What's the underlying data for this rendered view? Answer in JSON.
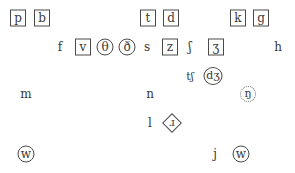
{
  "diagram": {
    "legend_styles": {
      "box": "boxed symbol",
      "circle": "circled symbol",
      "dcircle": "dotted-circle symbol",
      "diamond": "diamond-framed symbol",
      "plain": "unmarked symbol"
    },
    "symbols": [
      {
        "id": "p",
        "glyph": "p",
        "style": "box",
        "x": 18,
        "y": 18
      },
      {
        "id": "b",
        "glyph": "b",
        "style": "box",
        "x": 42,
        "y": 18
      },
      {
        "id": "t",
        "glyph": "t",
        "style": "box",
        "x": 148,
        "y": 18
      },
      {
        "id": "d",
        "glyph": "d",
        "style": "box",
        "x": 171,
        "y": 18
      },
      {
        "id": "k",
        "glyph": "k",
        "style": "box",
        "x": 238,
        "y": 18
      },
      {
        "id": "g",
        "glyph": "g",
        "style": "box",
        "x": 261,
        "y": 18
      },
      {
        "id": "f",
        "glyph": "f",
        "style": "plain",
        "x": 60,
        "y": 47
      },
      {
        "id": "v",
        "glyph": "v",
        "style": "box",
        "x": 83,
        "y": 47
      },
      {
        "id": "theta",
        "glyph": "θ",
        "style": "circle",
        "x": 105,
        "y": 47
      },
      {
        "id": "eth",
        "glyph": "ð",
        "style": "circle",
        "x": 127,
        "y": 47
      },
      {
        "id": "s",
        "glyph": "s",
        "style": "plain",
        "x": 147,
        "y": 47
      },
      {
        "id": "z",
        "glyph": "z",
        "style": "box",
        "x": 170,
        "y": 47
      },
      {
        "id": "esh",
        "glyph": "ʃ",
        "style": "plain",
        "x": 190,
        "y": 47
      },
      {
        "id": "ezh",
        "glyph": "ʒ",
        "style": "box",
        "x": 216,
        "y": 47
      },
      {
        "id": "h",
        "glyph": "h",
        "style": "plain",
        "x": 278,
        "y": 47
      },
      {
        "id": "tesh",
        "glyph": "tʃ",
        "style": "plain",
        "x": 190,
        "y": 76
      },
      {
        "id": "dezh",
        "glyph": "dʒ",
        "style": "circle-wide",
        "x": 213,
        "y": 76
      },
      {
        "id": "m",
        "glyph": "m",
        "style": "plain",
        "x": 26,
        "y": 94
      },
      {
        "id": "n",
        "glyph": "n",
        "style": "plain",
        "x": 150,
        "y": 94
      },
      {
        "id": "eng",
        "glyph": "ŋ",
        "style": "dcircle",
        "x": 248,
        "y": 94
      },
      {
        "id": "l",
        "glyph": "l",
        "style": "plain",
        "x": 150,
        "y": 123
      },
      {
        "id": "turned-r",
        "glyph": "ɹ",
        "style": "diamond",
        "x": 172,
        "y": 123
      },
      {
        "id": "w-left",
        "glyph": "w",
        "style": "circle",
        "x": 26,
        "y": 154
      },
      {
        "id": "j",
        "glyph": "j",
        "style": "plain",
        "x": 215,
        "y": 154
      },
      {
        "id": "w-right",
        "glyph": "w",
        "style": "circle",
        "x": 241,
        "y": 154
      }
    ]
  }
}
